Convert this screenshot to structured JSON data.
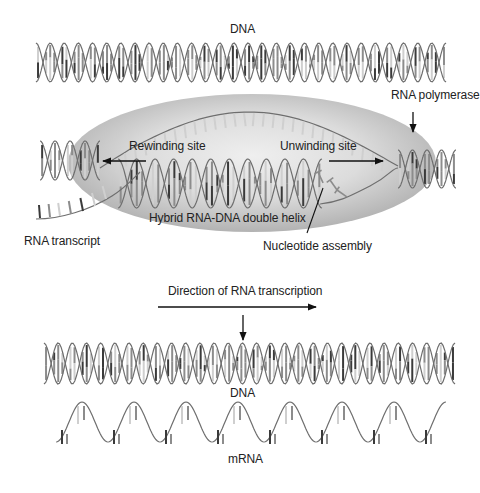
{
  "figure": {
    "colors": {
      "background": "#ffffff",
      "strand": "#6e6e6e",
      "base_dark": "#3a3a3a",
      "base_mid": "#8c8c8c",
      "base_light": "#cfcfcf",
      "polymerase_fill_center": "#e9e9e9",
      "polymerase_fill_edge": "#b5b5b5",
      "arrow": "#111111"
    }
  },
  "labels": {
    "dna_top": "DNA",
    "rna_polymerase": "RNA polymerase",
    "rewinding_site": "Rewinding site",
    "unwinding_site": "Unwinding site",
    "hybrid_helix": "Hybrid RNA-DNA double helix",
    "rna_transcript": "RNA transcript",
    "nucleotide_assembly": "Nucleotide assembly",
    "direction": "Direction of RNA transcription",
    "dna_bottom": "DNA",
    "mrna": "mRNA"
  },
  "elements": {
    "top_dna_helix": {
      "x0": 36,
      "x1": 446,
      "yTop": 43,
      "yBot": 82,
      "turns": 14.5
    },
    "polymerase_ellipse": {
      "cx": 252,
      "cy": 163,
      "rx": 184,
      "ry": 69
    },
    "left_small_helix": {
      "x0": 40,
      "x1": 100,
      "yTop": 141,
      "yBot": 180,
      "turns": 2
    },
    "right_small_helix": {
      "x0": 398,
      "x1": 456,
      "yTop": 150,
      "yBot": 188,
      "turns": 2
    },
    "hybrid_helix": {
      "x0": 118,
      "x1": 322,
      "yTop": 159,
      "yBot": 208,
      "turns": 5.5
    },
    "bottom_dna_helix": {
      "x0": 44,
      "x1": 455,
      "yTop": 343,
      "yBot": 384,
      "turns": 14.5
    },
    "mrna_wave": {
      "x0": 56,
      "x1": 446,
      "yTop": 408,
      "yBot": 448,
      "cycles": 7.5
    }
  }
}
